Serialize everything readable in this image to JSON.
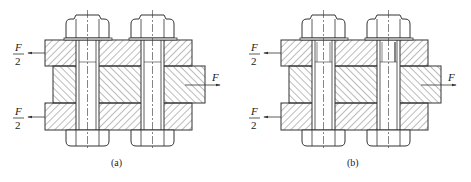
{
  "figure": {
    "panels": [
      {
        "id": "a",
        "caption": "(a)",
        "description": "Bolted double-shear lap joint with ordinary bolts in clearance holes",
        "forces": {
          "top_left": {
            "numerator": "F",
            "denominator": "2"
          },
          "bottom_left": {
            "numerator": "F",
            "denominator": "2"
          },
          "right": {
            "label": "F"
          }
        }
      },
      {
        "id": "b",
        "caption": "(b)",
        "description": "Bolted double-shear lap joint with fitted (reamed-hole) bolts",
        "forces": {
          "top_left": {
            "numerator": "F",
            "denominator": "2"
          },
          "bottom_left": {
            "numerator": "F",
            "denominator": "2"
          },
          "right": {
            "label": "F"
          }
        }
      }
    ],
    "colors": {
      "line": "#333333",
      "hatch": "#555555",
      "background": "#ffffff"
    }
  }
}
